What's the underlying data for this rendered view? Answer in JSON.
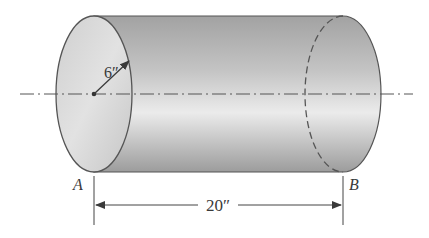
{
  "diagram": {
    "type": "cylinder-dimension-figure",
    "radius_label": "6″",
    "length_label": "20″",
    "end_labels": {
      "left": "A",
      "right": "B"
    },
    "colors": {
      "body_light": "#e6e6e6",
      "body_dark": "#9e9e9e",
      "face": "#d4d4d4",
      "outline": "#555555",
      "centerline": "#555555",
      "dimension": "#444444"
    }
  }
}
